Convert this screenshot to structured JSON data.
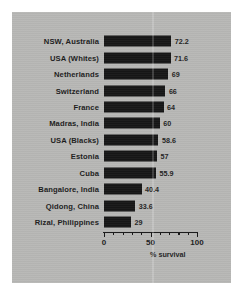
{
  "chart_data": {
    "type": "bar",
    "orientation": "horizontal",
    "title": "",
    "subtitle": "",
    "xlabel": "% survival",
    "ylabel": "",
    "xlim": [
      0,
      100
    ],
    "xticks": [
      0,
      50,
      100
    ],
    "xtick_labels": [
      "0",
      "50",
      "100"
    ],
    "minor_tick_interval": 10,
    "grid": false,
    "legend": null,
    "categories": [
      "NSW, Australia",
      "USA (Whites)",
      "Netherlands",
      "Switzerland",
      "France",
      "Madras, India",
      "USA (Blacks)",
      "Estonia",
      "Cuba",
      "Bangalore, India",
      "Qidong, China",
      "Rizal, Philippines"
    ],
    "values": [
      72.2,
      71.6,
      69,
      66,
      64,
      60,
      58.6,
      57,
      55.9,
      40.4,
      33.6,
      29
    ],
    "value_labels": [
      "72.2",
      "71.6",
      "69",
      "66",
      "64",
      "60",
      "58.6",
      "57",
      "55.9",
      "40.4",
      "33.6",
      "29"
    ],
    "colors": {
      "bar": "#161616",
      "background": "#b7b7b5",
      "figure_background": "#ffffff",
      "text": "#1b1b1b",
      "axis": "#151515"
    }
  }
}
